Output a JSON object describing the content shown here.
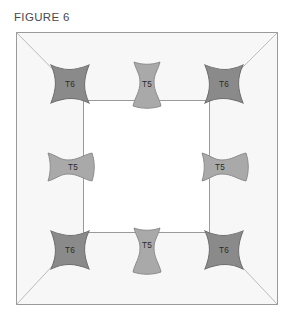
{
  "figure": {
    "title": "FIGURE 6",
    "caption_color": "#4a4a4a"
  },
  "diagram": {
    "outer_frame": {
      "name": "outer-square-frame",
      "x": 16,
      "y": 32,
      "width": 262,
      "height": 273,
      "fill": "#f7f7f7",
      "stroke": "#9a9a9a",
      "stroke_width": 1
    },
    "inner_frame": {
      "name": "inner-square-opening",
      "x": 83,
      "y": 100,
      "width": 127,
      "height": 133,
      "fill": "#ffffff",
      "stroke": "#9a9a9a",
      "stroke_width": 1
    },
    "diagonals": {
      "name": "corner-miter-lines",
      "stroke": "#b4b4b4",
      "stroke_width": 0.9,
      "lines": [
        {
          "name": "diagonal-top-left",
          "x1": 16,
          "y1": 32,
          "x2": 83,
          "y2": 100
        },
        {
          "name": "diagonal-top-right",
          "x1": 278,
          "y1": 32,
          "x2": 210,
          "y2": 100
        },
        {
          "name": "diagonal-bottom-left",
          "x1": 16,
          "y1": 305,
          "x2": 83,
          "y2": 233
        },
        {
          "name": "diagonal-bottom-right",
          "x1": 278,
          "y1": 305,
          "x2": 210,
          "y2": 233
        }
      ]
    },
    "legend_colors": {
      "t6_fill": "#8a8a8a",
      "t6_stroke": "#6e6e6e",
      "t5_fill": "#a9a9a9",
      "t5_stroke": "#8d8d8d",
      "label_text": "#2b2b2b"
    },
    "parts": [
      {
        "name": "corner-key-top-left",
        "label": "T6",
        "type": "bowtie-diamond",
        "position": "top-left",
        "cx": 70,
        "cy": 84,
        "rotation": -45,
        "fill": "#8a8a8a",
        "stroke": "#6e6e6e"
      },
      {
        "name": "edge-key-top-center",
        "label": "T5",
        "type": "bone-vertical",
        "position": "top-center",
        "cx": 147,
        "cy": 84,
        "rotation": 0,
        "fill": "#a9a9a9",
        "stroke": "#8d8d8d"
      },
      {
        "name": "corner-key-top-right",
        "label": "T6",
        "type": "bowtie-diamond",
        "position": "top-right",
        "cx": 224,
        "cy": 84,
        "rotation": 45,
        "fill": "#8a8a8a",
        "stroke": "#6e6e6e"
      },
      {
        "name": "edge-key-middle-left",
        "label": "T5",
        "type": "bone-horizontal",
        "position": "middle-left",
        "cx": 70,
        "cy": 167,
        "rotation": 0,
        "fill": "#a9a9a9",
        "stroke": "#8d8d8d"
      },
      {
        "name": "edge-key-middle-right",
        "label": "T5",
        "type": "bone-horizontal",
        "position": "middle-right",
        "cx": 224,
        "cy": 167,
        "rotation": 0,
        "fill": "#a9a9a9",
        "stroke": "#8d8d8d"
      },
      {
        "name": "corner-key-bottom-left",
        "label": "T6",
        "type": "bowtie-diamond",
        "position": "bottom-left",
        "cx": 70,
        "cy": 250,
        "rotation": 45,
        "fill": "#8a8a8a",
        "stroke": "#6e6e6e"
      },
      {
        "name": "edge-key-bottom-center",
        "label": "T5",
        "type": "bone-vertical",
        "position": "bottom-center",
        "cx": 147,
        "cy": 250,
        "rotation": 0,
        "fill": "#a9a9a9",
        "stroke": "#8d8d8d"
      },
      {
        "name": "corner-key-bottom-right",
        "label": "T6",
        "type": "bowtie-diamond",
        "position": "bottom-right",
        "cx": 224,
        "cy": 250,
        "rotation": -45,
        "fill": "#8a8a8a",
        "stroke": "#6e6e6e"
      }
    ]
  }
}
